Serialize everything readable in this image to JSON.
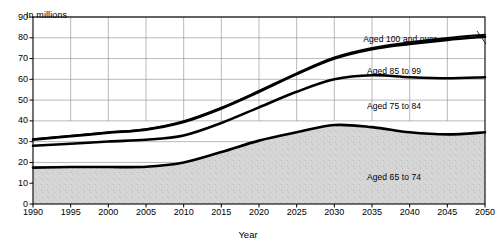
{
  "chart_data": {
    "type": "area",
    "title": "",
    "subtitle": "",
    "axis_unit_label": "In millions",
    "xlabel": "Year",
    "ylabel": "",
    "grid": true,
    "stacked": true,
    "legend_position": "inline-annotations",
    "xlim": [
      1990,
      2050
    ],
    "ylim": [
      0,
      90
    ],
    "ytick_step": 10,
    "xtick_step": 5,
    "x": [
      1990,
      1995,
      2000,
      2005,
      2010,
      2015,
      2020,
      2025,
      2030,
      2035,
      2040,
      2045,
      2050
    ],
    "xtick_labels": [
      "1990",
      "1995",
      "2000",
      "2005",
      "2010",
      "2015",
      "2020",
      "2025",
      "2030",
      "2035",
      "2040",
      "2045",
      "2050"
    ],
    "ytick_labels": [
      "0",
      "10",
      "20",
      "30",
      "40",
      "50",
      "60",
      "70",
      "80",
      "90"
    ],
    "series": [
      {
        "name": "Aged 65 to 74",
        "label": "Aged 65 to 74",
        "fill": "#d0d0d0",
        "values": [
          17.5,
          17.8,
          17.8,
          17.9,
          20.0,
          25.0,
          30.5,
          34.5,
          38.0,
          37.0,
          34.5,
          33.5,
          34.5
        ],
        "cumulative": [
          17.5,
          17.8,
          17.8,
          17.9,
          20.0,
          25.0,
          30.5,
          34.5,
          38.0,
          37.0,
          34.5,
          33.5,
          34.5
        ]
      },
      {
        "name": "Aged 75 to 84",
        "label": "Aged 75 to 84",
        "fill": "#ffffff",
        "values": [
          10.5,
          11.2,
          12.3,
          13.0,
          13.0,
          14.0,
          16.0,
          19.5,
          22.0,
          25.0,
          26.5,
          27.0,
          26.5
        ],
        "cumulative": [
          28.0,
          29.0,
          30.1,
          30.9,
          33.0,
          39.0,
          46.5,
          54.0,
          60.0,
          62.0,
          61.0,
          60.5,
          61.0
        ]
      },
      {
        "name": "Aged 85 to 99",
        "label": "Aged 85 to 99",
        "fill": "#ffffff",
        "values": [
          3.0,
          3.6,
          4.2,
          4.9,
          6.5,
          7.0,
          7.5,
          8.5,
          10.0,
          12.5,
          16.0,
          18.5,
          19.5
        ],
        "cumulative": [
          31.0,
          32.6,
          34.3,
          35.8,
          39.5,
          46.0,
          54.0,
          62.5,
          70.0,
          74.5,
          77.0,
          79.0,
          80.5
        ]
      },
      {
        "name": "Aged 100 and over",
        "label": "Aged 100 and over",
        "fill": "#ffffff",
        "values": [
          0.2,
          0.2,
          0.2,
          0.2,
          0.3,
          0.3,
          0.4,
          0.4,
          0.5,
          0.6,
          0.8,
          0.9,
          1.0
        ],
        "cumulative": [
          31.2,
          32.8,
          34.5,
          36.0,
          39.8,
          46.3,
          54.4,
          62.9,
          70.5,
          75.1,
          77.8,
          79.9,
          81.5
        ]
      }
    ],
    "annotations": [
      {
        "text": "Aged 100 and over",
        "x_px": 400,
        "y_px": 34,
        "leader": true
      },
      {
        "text": "Aged 85 to 99",
        "x_px": 394,
        "y_px": 66,
        "leader": false
      },
      {
        "text": "Aged 75 to 84",
        "x_px": 394,
        "y_px": 101,
        "leader": false
      },
      {
        "text": "Aged 65 to 74",
        "x_px": 394,
        "y_px": 172,
        "leader": false
      }
    ],
    "colors": {
      "line": "#000000",
      "grid": "#808080",
      "axis": "#000000",
      "band_fill": "#d0d0d0",
      "background": "#ffffff"
    }
  }
}
